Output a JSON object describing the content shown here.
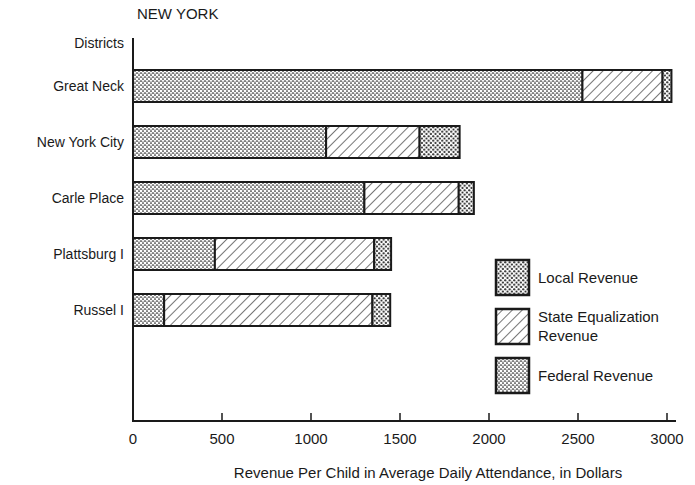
{
  "chart_data": {
    "type": "bar",
    "orientation": "horizontal",
    "stacked": true,
    "title": "NEW YORK",
    "ylabel": "Districts",
    "xlabel": "Revenue Per Child in Average Daily Attendance, in Dollars",
    "categories": [
      "Great Neck",
      "New York City",
      "Carle Place",
      "Plattsburg I",
      "Russel I"
    ],
    "series": [
      {
        "name": "Federal Revenue",
        "pattern": "fine-stipple",
        "values": [
          2525,
          1085,
          1300,
          460,
          175
        ]
      },
      {
        "name": "State Equalization Revenue",
        "pattern": "diagonal-hatch",
        "values": [
          450,
          525,
          530,
          895,
          1170
        ]
      },
      {
        "name": "Local Revenue",
        "pattern": "coarse-dots",
        "values": [
          50,
          225,
          85,
          95,
          100
        ]
      }
    ],
    "totals": [
      3025,
      1835,
      1915,
      1450,
      1445
    ],
    "xlim": [
      0,
      3000
    ],
    "xticks": [
      0,
      500,
      1000,
      1500,
      2000,
      2500,
      3000
    ],
    "grid": false,
    "legend": {
      "position": "lower-right-inside",
      "entries": [
        {
          "label_lines": [
            "Local Revenue"
          ],
          "pattern": "coarse-dots"
        },
        {
          "label_lines": [
            "State Equalization",
            "Revenue"
          ],
          "pattern": "diagonal-hatch"
        },
        {
          "label_lines": [
            "Federal Revenue"
          ],
          "pattern": "fine-stipple"
        }
      ]
    },
    "colors": {
      "ink": "#1a1a1a",
      "background": "#ffffff"
    }
  }
}
